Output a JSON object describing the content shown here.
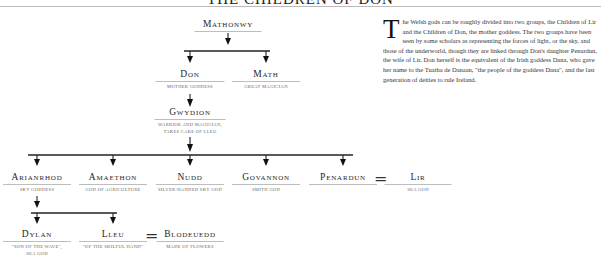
{
  "header": {
    "title": "THE CHILDREN OF DON"
  },
  "tree": {
    "mathonwy": {
      "name": "Mathonwy",
      "desc": ""
    },
    "don": {
      "name": "Don",
      "desc": "Mother goddess"
    },
    "math": {
      "name": "Math",
      "desc": "Great magician"
    },
    "gwydion": {
      "name": "Gwydion",
      "desc_line1": "Warrior and magician,",
      "desc_line2": "takes care of Lleu"
    },
    "arianrhod": {
      "name": "Arianrhod",
      "desc": "Sky goddess"
    },
    "amaethon": {
      "name": "Amaethon",
      "desc": "God of agriculture"
    },
    "nudd": {
      "name": "Nudd",
      "desc": "Silver-handed sky god"
    },
    "govannon": {
      "name": "Govannon",
      "desc": "Smith god"
    },
    "penardun": {
      "name": "Penardun",
      "desc": ""
    },
    "lir": {
      "name": "Lir",
      "desc": "Sea god"
    },
    "dylan": {
      "name": "Dylan",
      "desc_line1": "\"Son of the wave\",",
      "desc_line2": "sea god"
    },
    "lleu": {
      "name": "Lleu",
      "desc": "\"Of the skilful hand\""
    },
    "blodeuedd": {
      "name": "Blodeuedd",
      "desc": "Made of flowers"
    },
    "marriage_symbol": "="
  },
  "article": {
    "drop_cap": "T",
    "text": "he Welsh gods can be roughly divided into two groups, the Children of Lir and the Children of Don, the mother goddess. The two groups have been seen by some scholars as representing the forces of light, or the sky, and those of the underworld, though they are linked through Don's daughter Penardun, the wife of Lir. Don herself is the equivalent of the Irish goddess Dana, who gave her name to the Tuatha de Danaan, \"the people of the goddess Dana\", and the last generation of deities to rule Ireland."
  }
}
